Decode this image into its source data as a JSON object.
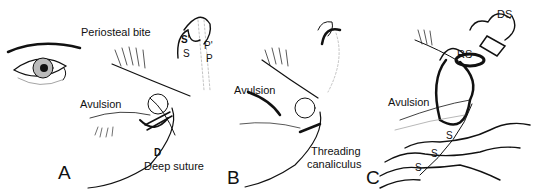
{
  "figure": {
    "panels": [
      {
        "id": "A",
        "letter": "A",
        "labels": {
          "periosteal_bite": "Periosteal bite",
          "s_prime": "S'",
          "s": "S",
          "p_prime": "P'",
          "p": "P",
          "avulsion": "Avulsion",
          "d": "D",
          "deep_suture": "Deep suture"
        }
      },
      {
        "id": "B",
        "letter": "B",
        "labels": {
          "avulsion": "Avulsion",
          "threading_line1": "Threading",
          "threading_line2": "canaliculus"
        }
      },
      {
        "id": "C",
        "letter": "C",
        "labels": {
          "ds": "DS",
          "rs": "RS",
          "avulsion": "Avulsion",
          "s1": "S",
          "s2": "S",
          "s3": "S"
        }
      }
    ],
    "colors": {
      "ink": "#111111",
      "shade": "#888888",
      "background": "#ffffff"
    }
  }
}
